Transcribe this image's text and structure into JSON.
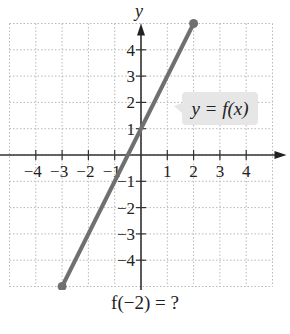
{
  "figure": {
    "x_axis_label": "x",
    "y_axis_label": "y",
    "x_tick_labels": [
      "-4",
      "-3",
      "-2",
      "-1",
      "1",
      "2",
      "3",
      "4"
    ],
    "y_tick_labels": [
      "4",
      "3",
      "2",
      "1",
      "-1",
      "-2",
      "-3",
      "-4"
    ],
    "x_ticks": [
      -4,
      -3,
      -2,
      -1,
      1,
      2,
      3,
      4
    ],
    "y_ticks": [
      4,
      3,
      2,
      1,
      -1,
      -2,
      -3,
      -4
    ],
    "grid_range": [
      -5,
      5
    ],
    "function_label": "y = f(x)",
    "segment": {
      "start": [
        -3,
        -5
      ],
      "end": [
        2,
        5
      ]
    },
    "line_color": "#707070",
    "label_bg_color": "#e6e6e6",
    "question": "f(−2) = ?"
  }
}
